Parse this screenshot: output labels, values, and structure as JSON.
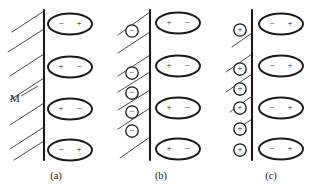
{
  "figure": {
    "title": "",
    "background_color": "#ffffff",
    "line_color": "#1a1a1a",
    "hatch_color": "#4a4a4a",
    "panels": [
      {
        "id": "a",
        "caption": "(a)",
        "caption_x": 56,
        "caption_y": 177,
        "wall_x": 44,
        "wall_top": 10,
        "wall_bottom": 160,
        "wall_label": "M",
        "wall_label_x": 10,
        "wall_label_y": 99,
        "leader_from_x": 21,
        "leader_from_y": 96,
        "leader_to_x": 38,
        "leader_to_y": 86,
        "hatch_lines": [
          {
            "x1": 12,
            "y1": 32,
            "x2": 44,
            "y2": 11
          },
          {
            "x1": 8,
            "y1": 52,
            "x2": 44,
            "y2": 29
          },
          {
            "x1": 10,
            "y1": 76,
            "x2": 44,
            "y2": 54
          },
          {
            "x1": 10,
            "y1": 100,
            "x2": 44,
            "y2": 78
          },
          {
            "x1": 10,
            "y1": 125,
            "x2": 44,
            "y2": 103
          },
          {
            "x1": 10,
            "y1": 149,
            "x2": 44,
            "y2": 127
          },
          {
            "x1": 14,
            "y1": 160,
            "x2": 44,
            "y2": 141
          }
        ],
        "ions": [],
        "dipoles": [
          {
            "cx": 70,
            "cy": 24,
            "left_sign": "−",
            "right_sign": "+"
          },
          {
            "cx": 70,
            "cy": 67,
            "left_sign": "+",
            "right_sign": "−"
          },
          {
            "cx": 70,
            "cy": 109,
            "left_sign": "+",
            "right_sign": "−"
          },
          {
            "cx": 70,
            "cy": 150,
            "left_sign": "−",
            "right_sign": "+"
          }
        ]
      },
      {
        "id": "b",
        "caption": "(b)",
        "caption_x": 161,
        "caption_y": 177,
        "wall_x": 150,
        "wall_top": 10,
        "wall_bottom": 160,
        "wall_label": "",
        "hatch_lines": [
          {
            "x1": 118,
            "y1": 35,
            "x2": 150,
            "y2": 12
          },
          {
            "x1": 118,
            "y1": 53,
            "x2": 150,
            "y2": 32
          },
          {
            "x1": 118,
            "y1": 76,
            "x2": 150,
            "y2": 55
          },
          {
            "x1": 118,
            "y1": 92,
            "x2": 150,
            "y2": 72
          },
          {
            "x1": 118,
            "y1": 110,
            "x2": 150,
            "y2": 90
          },
          {
            "x1": 118,
            "y1": 129,
            "x2": 150,
            "y2": 108
          },
          {
            "x1": 120,
            "y1": 158,
            "x2": 150,
            "y2": 137
          }
        ],
        "ions": [
          {
            "cx": 132,
            "cy": 31,
            "sign": "−"
          },
          {
            "cx": 132,
            "cy": 73,
            "sign": "−"
          },
          {
            "cx": 132,
            "cy": 93,
            "sign": "−"
          },
          {
            "cx": 132,
            "cy": 112,
            "sign": "−"
          },
          {
            "cx": 132,
            "cy": 131,
            "sign": "−"
          }
        ],
        "dipoles": [
          {
            "cx": 178,
            "cy": 23,
            "left_sign": "+",
            "right_sign": "−"
          },
          {
            "cx": 178,
            "cy": 66,
            "left_sign": "+",
            "right_sign": "−"
          },
          {
            "cx": 178,
            "cy": 108,
            "left_sign": "+",
            "right_sign": "−"
          },
          {
            "cx": 178,
            "cy": 149,
            "left_sign": "+",
            "right_sign": "−"
          }
        ]
      },
      {
        "id": "c",
        "caption": "(c)",
        "caption_x": 271,
        "caption_y": 177,
        "wall_x": 252,
        "wall_top": 10,
        "wall_bottom": 160,
        "wall_label": "",
        "hatch_lines": [
          {
            "x1": 232,
            "y1": 47,
            "x2": 252,
            "y2": 33
          },
          {
            "x1": 226,
            "y1": 72,
            "x2": 252,
            "y2": 54
          },
          {
            "x1": 226,
            "y1": 92,
            "x2": 252,
            "y2": 74
          },
          {
            "x1": 230,
            "y1": 112,
            "x2": 252,
            "y2": 96
          },
          {
            "x1": 236,
            "y1": 130,
            "x2": 252,
            "y2": 119
          }
        ],
        "ions": [
          {
            "cx": 240,
            "cy": 30,
            "sign": "+"
          },
          {
            "cx": 240,
            "cy": 69,
            "sign": "+"
          },
          {
            "cx": 240,
            "cy": 89,
            "sign": "+"
          },
          {
            "cx": 240,
            "cy": 108,
            "sign": "+"
          },
          {
            "cx": 240,
            "cy": 129,
            "sign": "+"
          },
          {
            "cx": 240,
            "cy": 150,
            "sign": "+"
          }
        ],
        "dipoles": [
          {
            "cx": 281,
            "cy": 24,
            "left_sign": "−",
            "right_sign": "+"
          },
          {
            "cx": 281,
            "cy": 66,
            "left_sign": "−",
            "right_sign": "+"
          },
          {
            "cx": 281,
            "cy": 108,
            "left_sign": "−",
            "right_sign": "+"
          },
          {
            "cx": 281,
            "cy": 149,
            "left_sign": "−",
            "right_sign": "+"
          }
        ]
      }
    ],
    "dipole_shape": {
      "rx": 22,
      "ry": 10.5,
      "sign_offset_x": 9
    },
    "ion_shape": {
      "r": 6.2
    }
  }
}
